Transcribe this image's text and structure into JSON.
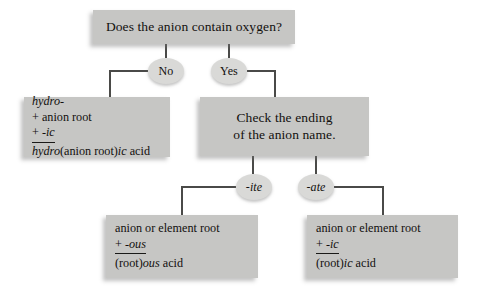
{
  "diagram": {
    "title_box": {
      "text": "Does the anion contain oxygen?"
    },
    "decisions": {
      "no": "No",
      "yes": "Yes",
      "ite": "-ite",
      "ate": "-ate"
    },
    "hydro_box": {
      "line1_italic": "hydro-",
      "line2": "+ anion root",
      "line3_plus": "+ ",
      "line3_italic": "-ic",
      "result_italic1": "hydro",
      "result_roman1": "(anion root)",
      "result_italic2": "ic",
      "result_roman2": " acid"
    },
    "check_box": {
      "line1": "Check the ending",
      "line2": "of the anion name."
    },
    "ous_box": {
      "line1": "anion or element root",
      "line2_plus": "+ ",
      "line2_italic": "-ous",
      "result_roman1": "(root)",
      "result_italic": "ous",
      "result_roman2": " acid"
    },
    "ic_box": {
      "line1": "anion or element root",
      "line2_plus": "+ ",
      "line2_italic": "-ic",
      "result_roman1": "(root)",
      "result_italic": "ic",
      "result_roman2": " acid"
    },
    "colors": {
      "box_fill": "#c6c6c4",
      "node_fill": "#d9d9d7",
      "line": "#4a4a48",
      "text": "#12100e",
      "background": "#ffffff"
    }
  }
}
